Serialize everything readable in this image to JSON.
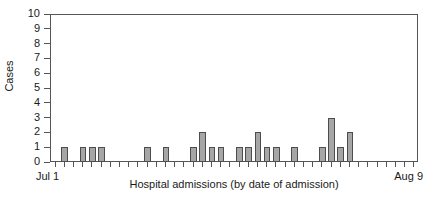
{
  "chart_data": {
    "type": "bar",
    "title": "",
    "xlabel": "Hospital admissions (by date of admission)",
    "ylabel": "Cases",
    "ylim": [
      0,
      10
    ],
    "ytick_labels": [
      "0",
      "1",
      "2",
      "3",
      "4",
      "5",
      "6",
      "7",
      "8",
      "9",
      "10"
    ],
    "ytick_values": [
      0,
      1,
      2,
      3,
      4,
      5,
      6,
      7,
      8,
      9,
      10
    ],
    "grid": false,
    "legend": null,
    "x_axis_start_label": "Jul 1",
    "x_axis_end_label": "Aug 9",
    "x_label_rotation": 0,
    "bar_color": "#a6a6a6",
    "bar_edge_color": "#4d4d4d",
    "axis_color": "#555555",
    "n_days": 40,
    "categories": [
      "Jul 1",
      "Jul 2",
      "Jul 3",
      "Jul 4",
      "Jul 5",
      "Jul 6",
      "Jul 7",
      "Jul 8",
      "Jul 9",
      "Jul 10",
      "Jul 11",
      "Jul 12",
      "Jul 13",
      "Jul 14",
      "Jul 15",
      "Jul 16",
      "Jul 17",
      "Jul 18",
      "Jul 19",
      "Jul 20",
      "Jul 21",
      "Jul 22",
      "Jul 23",
      "Jul 24",
      "Jul 25",
      "Jul 26",
      "Jul 27",
      "Jul 28",
      "Jul 29",
      "Jul 30",
      "Jul 31",
      "Aug 1",
      "Aug 2",
      "Aug 3",
      "Aug 4",
      "Aug 5",
      "Aug 6",
      "Aug 7",
      "Aug 8",
      "Aug 9"
    ],
    "values": [
      0,
      1,
      0,
      1,
      1,
      1,
      0,
      0,
      0,
      0,
      1,
      0,
      1,
      0,
      0,
      1,
      2,
      1,
      1,
      0,
      1,
      1,
      2,
      1,
      1,
      0,
      1,
      0,
      0,
      1,
      3,
      1,
      2,
      0,
      0,
      0,
      0,
      0,
      0,
      0
    ]
  }
}
